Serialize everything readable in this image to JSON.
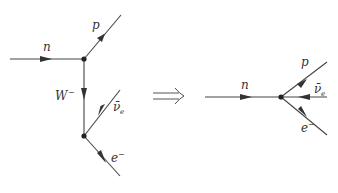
{
  "colors": {
    "line": "#333333",
    "text": "#3a3a3a",
    "background": "#ffffff"
  },
  "left_diagram": {
    "labels": {
      "neutron": "n",
      "proton": "p",
      "w_boson": "W",
      "w_charge": "−",
      "antineutrino": "ν̄",
      "antineutrino_sub": "e",
      "electron": "e",
      "electron_charge": "−"
    }
  },
  "implies_symbol": "⟹",
  "right_diagram": {
    "labels": {
      "neutron": "n",
      "proton": "p",
      "antineutrino": "ν̄",
      "antineutrino_sub": "e",
      "electron": "e",
      "electron_charge": "−"
    }
  }
}
